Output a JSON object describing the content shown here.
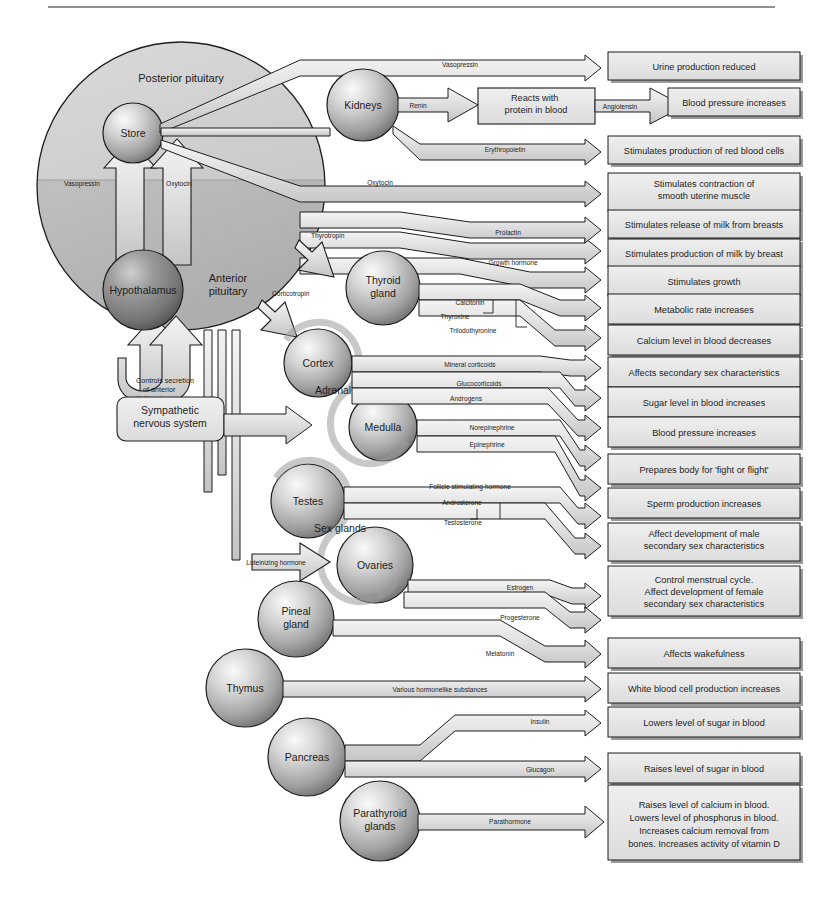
{
  "diagram": {
    "top_rule": true,
    "colors": {
      "outline": "#1d1d1d",
      "pipe_fill": "#dcdcdc",
      "box_fill": "#e3e3e3",
      "box_shadow": "#8c8c8c",
      "sphere_light": "#f2f2f2",
      "sphere_mid": "#b4b4b4",
      "sphere_dark": "#6e6e6e",
      "pituitary_fill": "#c9c9c9",
      "anterior_fill": "#bdbdbd"
    }
  },
  "pituitary": {
    "posterior_label": "Posterior pituitary",
    "anterior_label": "Anterior pituitary",
    "store_label": "Store",
    "hypothalamus_label": "Hypothalamus",
    "vasopressin_label": "Vasopressin",
    "oxytocin_label": "Oxytocin",
    "feedback_note": "Controls secretion of anterior pituitary hormones",
    "feedback_line1": "Controls secretion",
    "feedback_line2": "of anterior",
    "feedback_line3": "pituitary hormones"
  },
  "glands": [
    {
      "id": "kidneys",
      "label": "Kidneys",
      "label2": ""
    },
    {
      "id": "thyroid",
      "label": "Thyroid",
      "label2": "gland"
    },
    {
      "id": "cortex",
      "label": "Cortex",
      "label2": ""
    },
    {
      "id": "medulla",
      "label": "Medulla",
      "label2": ""
    },
    {
      "id": "testes",
      "label": "Testes",
      "label2": ""
    },
    {
      "id": "ovaries",
      "label": "Ovaries",
      "label2": ""
    },
    {
      "id": "pineal",
      "label": "Pineal",
      "label2": "gland"
    },
    {
      "id": "thymus",
      "label": "Thymus",
      "label2": ""
    },
    {
      "id": "pancreas",
      "label": "Pancreas",
      "label2": ""
    },
    {
      "id": "parathyroid",
      "label": "Parathyroid",
      "label2": "glands"
    }
  ],
  "group_labels": {
    "adrenal": "Adrenal glands",
    "sex": "Sex glands"
  },
  "sympathetic": {
    "line1": "Sympathetic",
    "line2": "nervous system"
  },
  "intermediate_box": {
    "line1": "Reacts with",
    "line2": "protein in blood"
  },
  "hormones": [
    {
      "id": "vasopressin",
      "label": "Vasopressin"
    },
    {
      "id": "renin",
      "label": "Renin"
    },
    {
      "id": "angiotensin",
      "label": "Angiotensin"
    },
    {
      "id": "erythropoietin",
      "label": "Erythropoietin"
    },
    {
      "id": "oxytocin",
      "label": "Oxytocin"
    },
    {
      "id": "prolactin",
      "label": "Prolactin"
    },
    {
      "id": "thyrotropin",
      "label": "Thyrotropin"
    },
    {
      "id": "growth",
      "label": "Growth hormone"
    },
    {
      "id": "corticotropin",
      "label": "Corticotropin"
    },
    {
      "id": "calcitonin",
      "label": "Calcitonin"
    },
    {
      "id": "thyroxine",
      "label": "Thyroxine"
    },
    {
      "id": "triiodothyronine",
      "label": "Triiodothyronine"
    },
    {
      "id": "mineral",
      "label": "Mineral corticoids"
    },
    {
      "id": "gluco",
      "label": "Glucocorticoids"
    },
    {
      "id": "androgens",
      "label": "Androgens"
    },
    {
      "id": "norepinephrine",
      "label": "Norepinephrine"
    },
    {
      "id": "epinephrine",
      "label": "Epinephrine"
    },
    {
      "id": "fsh",
      "label": "Follicle stimulating hormone"
    },
    {
      "id": "androsterone",
      "label": "Androsterone"
    },
    {
      "id": "testosterone",
      "label": "Testosterone"
    },
    {
      "id": "lh",
      "label": "Luteinizing hormone"
    },
    {
      "id": "estrogen",
      "label": "Estrogen"
    },
    {
      "id": "progesterone",
      "label": "Progesterone"
    },
    {
      "id": "melatonin",
      "label": "Melatonin"
    },
    {
      "id": "various",
      "label": "Various hormonelike substances"
    },
    {
      "id": "insulin",
      "label": "Insulin"
    },
    {
      "id": "glucagon",
      "label": "Glucagon"
    },
    {
      "id": "parathormone",
      "label": "Parathormone"
    }
  ],
  "effects": [
    {
      "id": "e1",
      "lines": [
        "Urine production reduced"
      ]
    },
    {
      "id": "e2",
      "lines": [
        "Blood pressure increases"
      ]
    },
    {
      "id": "e3",
      "lines": [
        "Stimulates production of red blood cells"
      ]
    },
    {
      "id": "e4",
      "lines": [
        "Stimulates contraction of",
        "smooth uterine muscle"
      ]
    },
    {
      "id": "e5",
      "lines": [
        "Stimulates release of milk from breasts"
      ]
    },
    {
      "id": "e6",
      "lines": [
        "Stimulates production of milk by breast"
      ]
    },
    {
      "id": "e7",
      "lines": [
        "Stimulates growth"
      ]
    },
    {
      "id": "e8",
      "lines": [
        "Metabolic rate increases"
      ]
    },
    {
      "id": "e9",
      "lines": [
        "Calcium level in  blood decreases"
      ]
    },
    {
      "id": "e10",
      "lines": [
        "Affects secondary sex characteristics"
      ]
    },
    {
      "id": "e11",
      "lines": [
        "Sugar level in blood increases"
      ]
    },
    {
      "id": "e12",
      "lines": [
        "Blood pressure increases"
      ]
    },
    {
      "id": "e13",
      "lines": [
        "Prepares body for 'fight or flight'"
      ]
    },
    {
      "id": "e14",
      "lines": [
        "Sperm production increases"
      ]
    },
    {
      "id": "e15",
      "lines": [
        "Affect development of male",
        "secondary sex characteristics"
      ]
    },
    {
      "id": "e16",
      "lines": [
        "Control menstrual cycle.",
        "Affect development  of  female",
        "secondary sex characteristics"
      ]
    },
    {
      "id": "e17",
      "lines": [
        "Affects wakefulness"
      ]
    },
    {
      "id": "e18",
      "lines": [
        "White blood cell production increases"
      ]
    },
    {
      "id": "e19",
      "lines": [
        "Lowers level of sugar in blood"
      ]
    },
    {
      "id": "e20",
      "lines": [
        "Raises level of  sugar in blood"
      ]
    },
    {
      "id": "e21",
      "lines": [
        "Raises  level  of  calcium  in  blood.",
        "Lowers level of phosphorus in blood.",
        "Increases   calcium   removal   from",
        "bones. Increases activity of vitamin D"
      ]
    }
  ]
}
